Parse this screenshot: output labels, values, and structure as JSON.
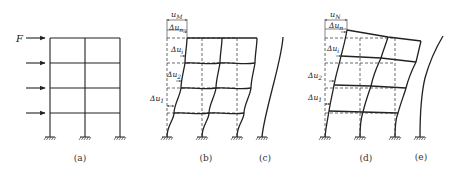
{
  "figure": {
    "panels": [
      {
        "id": "a",
        "caption": "(a)",
        "description": "four-storey two-bay frame under lateral loads"
      },
      {
        "id": "b",
        "caption": "(b)",
        "description": "shear-type deformation of frame"
      },
      {
        "id": "c",
        "caption": "(c)",
        "description": "shear-type deflection curve"
      },
      {
        "id": "d",
        "caption": "(d)",
        "description": "flexural-type deformation of frame"
      },
      {
        "id": "e",
        "caption": "(e)",
        "description": "flexural-type deflection curve"
      }
    ],
    "labels": {
      "force": "F",
      "top_disp_b": {
        "main": "u",
        "sub": "M"
      },
      "top_disp_d": {
        "main": "u",
        "sub": "N"
      },
      "drifts": [
        {
          "main": "Δu",
          "sub": "n"
        },
        {
          "main": "Δu",
          "sub": "i"
        },
        {
          "main": "Δu",
          "sub": "2"
        },
        {
          "main": "Δu",
          "sub": "1"
        }
      ]
    }
  }
}
